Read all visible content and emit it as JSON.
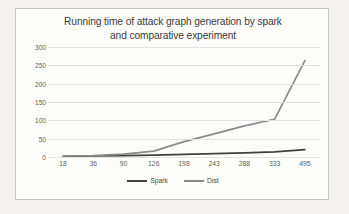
{
  "chart_data": {
    "type": "line",
    "title": "Running time of attack graph generation by spark and comparative experiment",
    "title_lines": [
      "Running time of attack graph generation by spark",
      "and comparative experiment"
    ],
    "xlabel": "",
    "ylabel": "",
    "categories": [
      "18",
      "36",
      "90",
      "126",
      "198",
      "243",
      "288",
      "333",
      "495"
    ],
    "yticks": [
      "0",
      "50",
      "100",
      "150",
      "200",
      "250",
      "300"
    ],
    "ylim": [
      0,
      300
    ],
    "grid": true,
    "legend_position": "bottom",
    "series": [
      {
        "name": "Spark",
        "color": "#404040",
        "values": [
          2,
          3,
          4,
          5,
          7,
          9,
          11,
          14,
          20
        ]
      },
      {
        "name": "Dist",
        "color": "#8a8a8a",
        "values": [
          2,
          4,
          8,
          16,
          42,
          63,
          85,
          103,
          263
        ]
      }
    ]
  },
  "colors": {
    "page_background": "#f3f2ef",
    "card_background": "#fdfdfc",
    "card_border": "#c8c8c4",
    "gridline": "#e2e2df",
    "axis_text": "#5d5d5d",
    "title_text": "#3b3b3b"
  }
}
